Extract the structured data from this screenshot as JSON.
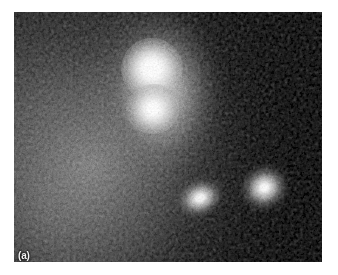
{
  "figure": {
    "panel_label": "(a)",
    "modality": "grayscale astronomical image",
    "frame": {
      "x": 14,
      "y": 12,
      "width": 308,
      "height": 250
    },
    "page_background": "#ffffff",
    "sky_background": "#060606"
  },
  "chart_data": {
    "type": "heatmap",
    "title": "",
    "subtitle": "",
    "xlabel": "",
    "ylabel": "",
    "grid": false,
    "legend_position": "none",
    "colormap": "grayscale",
    "value_range": [
      0,
      255
    ],
    "annotations": [
      {
        "label": "(a)",
        "x": 18,
        "y": 252,
        "color": "#f2f2f2"
      }
    ],
    "sources": [
      {
        "id": "source-a",
        "label": "upper bright nucleus",
        "x": 152,
        "y": 69,
        "peak_brightness": 255,
        "fwhm_px": 17,
        "shape": "point-like",
        "position_angle_deg": 0
      },
      {
        "id": "source-b",
        "label": "lower bright nucleus",
        "x": 153,
        "y": 109,
        "peak_brightness": 252,
        "fwhm_px": 15,
        "shape": "point-like",
        "position_angle_deg": 0
      },
      {
        "id": "source-c",
        "label": "lower-left companion",
        "x": 200,
        "y": 198,
        "peak_brightness": 236,
        "fwhm_px": 20,
        "shape": "elongated",
        "position_angle_deg": -22
      },
      {
        "id": "source-d",
        "label": "lower-right companion",
        "x": 266,
        "y": 188,
        "peak_brightness": 246,
        "fwhm_px": 22,
        "shape": "elongated",
        "position_angle_deg": -28
      }
    ],
    "diffuse_components": [
      {
        "id": "main-halo",
        "label": "extended halo around upper pair",
        "center_x": 152,
        "center_y": 92,
        "semi_major_px": 86,
        "semi_minor_px": 58,
        "position_angle_deg": 0,
        "mean_brightness": 150
      },
      {
        "id": "background-nebulosity",
        "label": "broad low-surface-brightness emission, left half",
        "center_x": 94,
        "center_y": 167,
        "semi_major_px": 230,
        "semi_minor_px": 190,
        "position_angle_deg": 0,
        "mean_brightness": 92
      }
    ],
    "background_levels": {
      "upper_right_dark_sky": 10,
      "lower_left_glow": 96,
      "noise_rms": 26
    }
  }
}
